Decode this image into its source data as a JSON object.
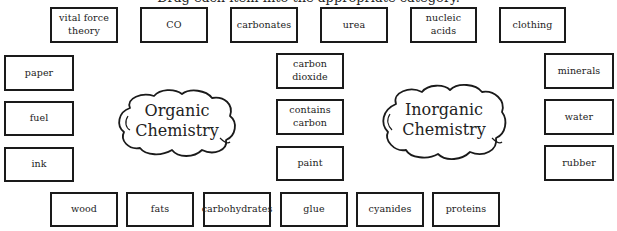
{
  "instruction": {
    "text": "Drag each item into the appropriate category."
  },
  "categories": [
    {
      "id": "organic",
      "label_line1": "Organic",
      "label_line2": "Chemistry"
    },
    {
      "id": "inorganic",
      "label_line1": "Inorganic",
      "label_line2": "Chemistry"
    }
  ],
  "cards": {
    "top": [
      {
        "label_line1": "vital force",
        "label_line2": "theory"
      },
      {
        "label": "CO"
      },
      {
        "label": "carbonates"
      },
      {
        "label": "urea"
      },
      {
        "label": "nucleic acids"
      },
      {
        "label": "clothing"
      }
    ],
    "left": [
      {
        "label": "paper"
      },
      {
        "label": "fuel"
      },
      {
        "label": "ink"
      }
    ],
    "middle": [
      {
        "label": "carbon dioxide"
      },
      {
        "label": "contains carbon"
      },
      {
        "label": "paint"
      }
    ],
    "right": [
      {
        "label": "minerals"
      },
      {
        "label": "water"
      },
      {
        "label": "rubber"
      }
    ],
    "bottom": [
      {
        "label": "wood"
      },
      {
        "label": "fats"
      },
      {
        "label": "carbohydrates"
      },
      {
        "label": "glue"
      },
      {
        "label": "cyanides"
      },
      {
        "label": "proteins"
      }
    ]
  },
  "colors": {
    "border": "#1a1a1a",
    "text": "#222222",
    "background": "#ffffff"
  }
}
